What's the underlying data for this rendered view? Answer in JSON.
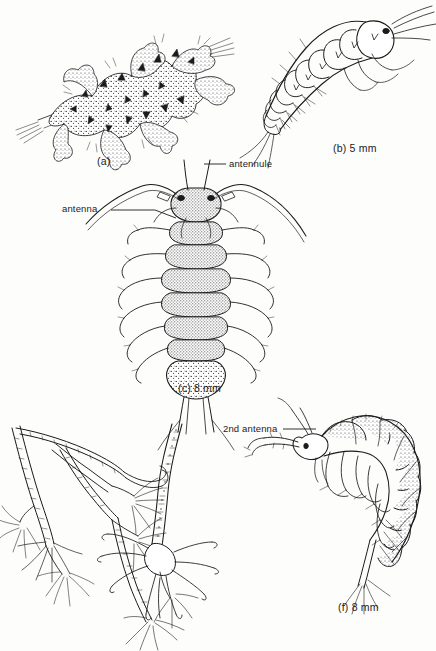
{
  "figure": {
    "background_color": "#fdfdfb",
    "ink_color": "#1b1b1b",
    "width_px": 436,
    "height_px": 651
  },
  "captions": {
    "a": "(a)",
    "b": "(b) 5 mm",
    "c": "(c) 8 mm",
    "f": "(f) 8 mm"
  },
  "annotations": {
    "antennule": "antennule",
    "antenna": "antenna",
    "second_antenna": "2nd antenna"
  },
  "panels": [
    {
      "key": "a",
      "caption": "(a)",
      "subject": "branching moss / bryozoan colony on twig",
      "orientation": "diagonal from lower-left to upper-right"
    },
    {
      "key": "b",
      "caption": "(b) 5 mm",
      "subject": "mayfly nymph, lateral view with caudal filaments",
      "orientation": "curved, head upper-right"
    },
    {
      "key": "c",
      "caption": "(c) 8 mm",
      "subject": "aquatic isopod, dorsal view",
      "orientation": "head up, uropods down",
      "labels": [
        "antennule",
        "antenna"
      ]
    },
    {
      "key": "d",
      "caption": "",
      "subject": "colonial hydroid with several stalks and tentacle crowns",
      "orientation": "branching"
    },
    {
      "key": "e",
      "caption": "",
      "subject": "single hydra with basal tentacle crown",
      "orientation": "vertical stalk, tentacles at base"
    },
    {
      "key": "f",
      "caption": "(f) 8 mm",
      "subject": "amphipod (Gammarus-type), lateral view, C-curved body",
      "orientation": "head upper-left, telson lower-centre",
      "labels": [
        "2nd antenna"
      ]
    }
  ]
}
